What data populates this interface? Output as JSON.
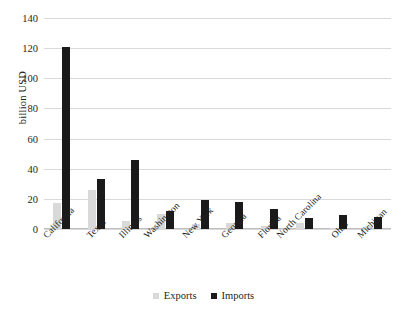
{
  "chart_data": {
    "type": "bar",
    "title": "",
    "xlabel": "",
    "ylabel": "billion USD",
    "ylim": [
      0,
      140
    ],
    "yticks": [
      0,
      20,
      40,
      60,
      80,
      100,
      120,
      140
    ],
    "grid": true,
    "legend_position": "bottom",
    "categories": [
      "California",
      "Texas",
      "Illinois",
      "Washington",
      "New York",
      "Georgia",
      "Florida",
      "North Carolina",
      "Ohio",
      "Michigan"
    ],
    "series": [
      {
        "name": "Exports",
        "color": "#d9d9d9",
        "values": [
          17,
          26,
          5,
          10,
          3,
          4,
          2,
          4,
          1,
          2
        ]
      },
      {
        "name": "Imports",
        "color": "#1a1a1a",
        "values": [
          120.5,
          33,
          46,
          12,
          19,
          18,
          13,
          7,
          9,
          8
        ]
      }
    ]
  },
  "legend": {
    "items": [
      {
        "label": "Exports"
      },
      {
        "label": "Imports"
      }
    ]
  },
  "colors": {
    "exports": "#d9d9d9",
    "imports": "#1a1a1a",
    "gridline": "#d9d9d9",
    "text": "#231f20",
    "background": "#ffffff"
  }
}
